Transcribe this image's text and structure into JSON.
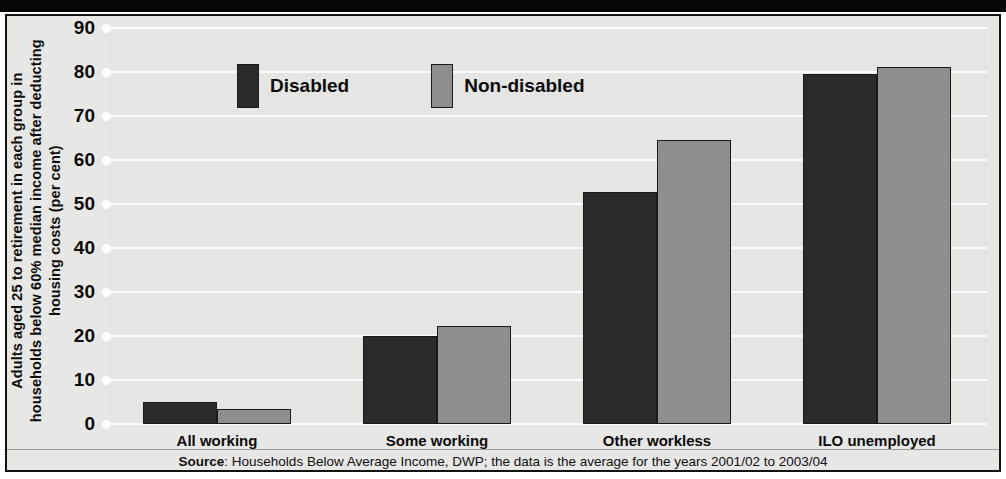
{
  "chart_data": {
    "type": "bar",
    "title": "",
    "xlabel": "",
    "ylabel": "Adults aged 25 to retirement in each group in households below 60% median income after deducting housing costs (per cent)",
    "categories": [
      "All working",
      "Some working",
      "Other workless",
      "ILO unemployed"
    ],
    "series": [
      {
        "name": "Disabled",
        "color": "#2b2b2b",
        "values": [
          4.9,
          20.1,
          52.7,
          79.6
        ]
      },
      {
        "name": "Non-disabled",
        "color": "#8e8e8e",
        "values": [
          3.3,
          22.2,
          64.6,
          81.2
        ]
      }
    ],
    "ylim": [
      0,
      90
    ],
    "yticks": [
      0,
      10,
      20,
      30,
      40,
      50,
      60,
      70,
      80,
      90
    ],
    "ytick_labels": [
      "0",
      "10",
      "20",
      "30",
      "40",
      "50",
      "60",
      "70",
      "80",
      "90"
    ],
    "grid": true,
    "legend_position": "top-left-inside",
    "annotations": []
  },
  "source": {
    "prefix": "Source",
    "text": ": Households Below Average Income, DWP; the data is the average for the years 2001/02 to 2003/04"
  }
}
